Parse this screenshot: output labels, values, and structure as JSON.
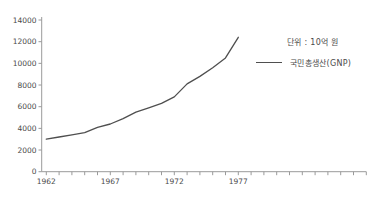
{
  "page": {
    "background": "#ffffff"
  },
  "unit_note": "단위 : 10억 원",
  "legend": {
    "series_label": "국민총생산(GNP)"
  },
  "chart_data": {
    "type": "line",
    "title": "",
    "xlabel": "",
    "ylabel": "",
    "unit_label": "단위 : 10억 원",
    "x": [
      1962,
      1963,
      1964,
      1965,
      1966,
      1967,
      1968,
      1969,
      1970,
      1971,
      1972,
      1973,
      1974,
      1975,
      1976,
      1977
    ],
    "series": [
      {
        "name": "국민총생산(GNP)",
        "values": [
          3000,
          3200,
          3400,
          3600,
          4100,
          4400,
          4900,
          5500,
          5900,
          6300,
          6900,
          8100,
          8800,
          9600,
          10500,
          12400
        ]
      }
    ],
    "ylim": [
      0,
      14000
    ],
    "y_ticks": [
      0,
      2000,
      4000,
      6000,
      8000,
      10000,
      12000,
      14000
    ],
    "x_axis_tick_years": {
      "start": 1962,
      "end": 1987,
      "step": 1
    },
    "x_tick_labels": [
      1962,
      1967,
      1972,
      1977
    ],
    "grid": false,
    "legend_position": "right",
    "colors": {
      "line": "#4f4f4f",
      "axis": "#9a9a9a",
      "tick": "#9a9a9a",
      "label": "#4a4a4a"
    }
  }
}
